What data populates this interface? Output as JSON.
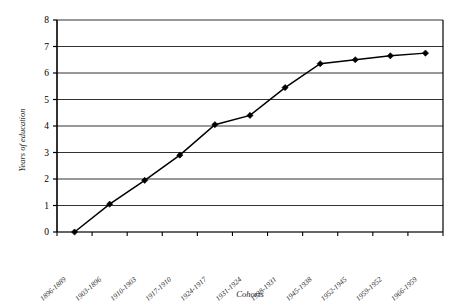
{
  "chart_data": {
    "type": "line",
    "title": "",
    "subtitle": "",
    "xlabel": "Cohorts",
    "ylabel": "Years of education",
    "ylim": [
      0,
      8
    ],
    "yticks": [
      "0",
      "1",
      "2",
      "3",
      "4",
      "5",
      "6",
      "7",
      "8"
    ],
    "grid": "horizontal",
    "legend": "none",
    "marker": "diamond",
    "line_color": "#000000",
    "marker_color": "#000000",
    "grid_color": "#333333",
    "axis_color": "#000000",
    "background": "#ffffff",
    "categories": [
      "1896-1889",
      "1903-1896",
      "1910-1903",
      "1917-1910",
      "1924-1917",
      "1931-1924",
      "1938-1931",
      "1945-1938",
      "1952-1945",
      "1959-1952",
      "1966-1959"
    ],
    "values": [
      0.0,
      1.05,
      1.95,
      2.9,
      4.05,
      4.4,
      5.45,
      6.35,
      6.5,
      6.65,
      6.75
    ],
    "series": [
      {
        "name": "Years of education",
        "values": [
          0.0,
          1.05,
          1.95,
          2.9,
          4.05,
          4.4,
          5.45,
          6.35,
          6.5,
          6.65,
          6.75
        ]
      }
    ]
  },
  "axes": {
    "y_title": "Years of education",
    "x_title": "Cohorts"
  }
}
